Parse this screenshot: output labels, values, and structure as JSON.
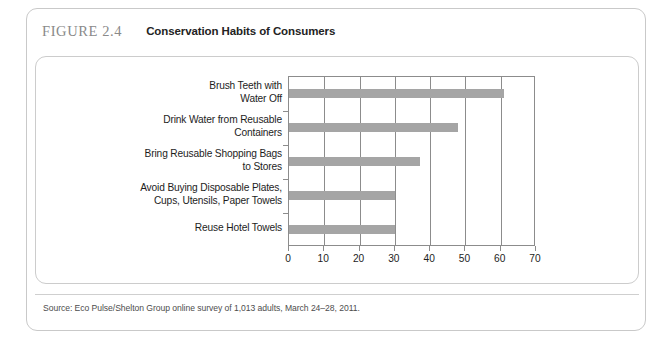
{
  "figure": {
    "number": "FIGURE 2.4",
    "title": "Conservation Habits of Consumers",
    "source": "Source: Eco Pulse/Shelton Group online survey of 1,013 adults, March 24–28, 2011."
  },
  "colors": {
    "bar": "#a5a5a5",
    "axis": "#8c8c8c",
    "frame": "#c9c9c9",
    "figure_number_text": "#8a8a8a",
    "title_text": "#232323"
  },
  "chart_data": {
    "type": "bar",
    "orientation": "horizontal",
    "title": "Conservation Habits of Consumers",
    "xlabel": "",
    "ylabel": "",
    "xlim": [
      0,
      70
    ],
    "xticks": [
      0,
      10,
      20,
      30,
      40,
      50,
      60,
      70
    ],
    "xtick_labels": [
      "0",
      "10",
      "20",
      "30",
      "40",
      "50",
      "60",
      "70"
    ],
    "grid": true,
    "legend": null,
    "categories": [
      "Brush Teeth with Water Off",
      "Drink Water from Reusable Containers",
      "Bring Reusable Shopping Bags to Stores",
      "Avoid Buying Disposable Plates, Cups, Utensils, Paper Towels",
      "Reuse Hotel Towels"
    ],
    "category_lines": [
      [
        "Brush Teeth with",
        "Water Off"
      ],
      [
        "Drink Water from Reusable",
        "Containers"
      ],
      [
        "Bring Reusable Shopping Bags",
        "to Stores"
      ],
      [
        "Avoid Buying Disposable Plates,",
        "Cups, Utensils, Paper Towels"
      ],
      [
        "Reuse Hotel Towels"
      ]
    ],
    "values": [
      61,
      48,
      37,
      30,
      30
    ]
  }
}
